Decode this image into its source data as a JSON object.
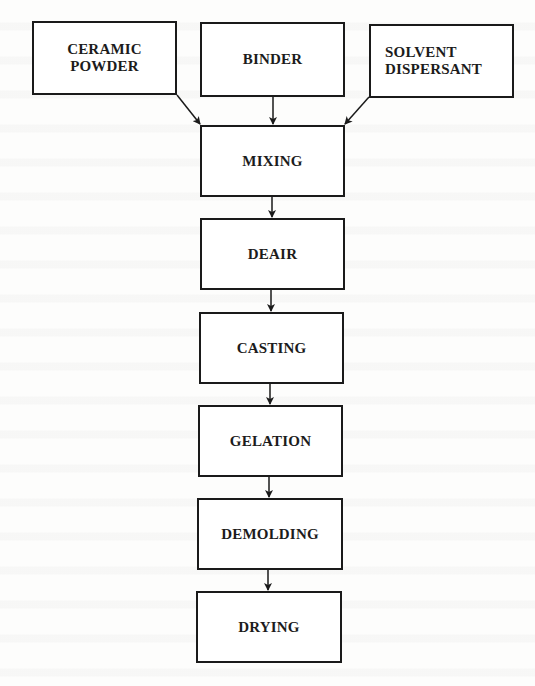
{
  "diagram": {
    "type": "flowchart",
    "direction": "top-to-bottom",
    "inputs": [
      {
        "id": "ceramic-powder",
        "label": "CERAMIC\nPOWDER"
      },
      {
        "id": "binder",
        "label": "BINDER"
      },
      {
        "id": "solvent-dispersant",
        "label": "SOLVENT\nDISPERSANT"
      }
    ],
    "steps": [
      {
        "id": "mixing",
        "label": "MIXING"
      },
      {
        "id": "deair",
        "label": "DEAIR"
      },
      {
        "id": "casting",
        "label": "CASTING"
      },
      {
        "id": "gelation",
        "label": "GELATION"
      },
      {
        "id": "demolding",
        "label": "DEMOLDING"
      },
      {
        "id": "drying",
        "label": "DRYING"
      }
    ],
    "edges": [
      {
        "from": "ceramic-powder",
        "to": "mixing"
      },
      {
        "from": "binder",
        "to": "mixing"
      },
      {
        "from": "solvent-dispersant",
        "to": "mixing"
      },
      {
        "from": "mixing",
        "to": "deair"
      },
      {
        "from": "deair",
        "to": "casting"
      },
      {
        "from": "casting",
        "to": "gelation"
      },
      {
        "from": "gelation",
        "to": "demolding"
      },
      {
        "from": "demolding",
        "to": "drying"
      }
    ],
    "colors": {
      "stroke": "#1a1a1a",
      "text": "#1c1c1c",
      "background": "#ffffff"
    }
  }
}
